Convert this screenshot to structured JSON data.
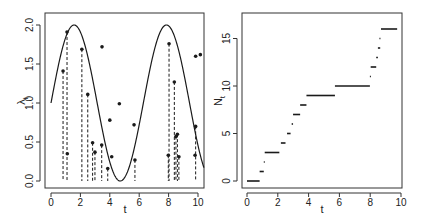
{
  "chart_data": [
    {
      "type": "scatter",
      "title": "",
      "xlabel": "t",
      "ylabel": "λ_t",
      "ylabel_main": "λ",
      "ylabel_sub": "t",
      "xlim": [
        0,
        10.4
      ],
      "ylim": [
        -0.05,
        2.1
      ],
      "xticks": [
        0,
        2,
        4,
        6,
        8,
        10
      ],
      "yticks": [
        0.0,
        0.5,
        1.0,
        1.5,
        2.0
      ],
      "ytick_labels": [
        "0.0",
        "0.5",
        "1.0",
        "1.5",
        "2.0"
      ],
      "grid": false,
      "legend": null,
      "curve": {
        "name": "intensity",
        "formula": "1 + sin(t)",
        "t_range": [
          0,
          10.4
        ],
        "style": "solid"
      },
      "points": [
        {
          "t": 0.82,
          "y": 1.41
        },
        {
          "t": 1.09,
          "y": 1.91
        },
        {
          "t": 1.11,
          "y": 0.35
        },
        {
          "t": 2.1,
          "y": 1.69
        },
        {
          "t": 2.5,
          "y": 1.11
        },
        {
          "t": 2.83,
          "y": 0.49
        },
        {
          "t": 2.99,
          "y": 0.37
        },
        {
          "t": 3.45,
          "y": 0.46
        },
        {
          "t": 3.47,
          "y": 1.72
        },
        {
          "t": 3.86,
          "y": 0.16
        },
        {
          "t": 4.0,
          "y": 0.78
        },
        {
          "t": 4.13,
          "y": 0.31
        },
        {
          "t": 4.65,
          "y": 0.99
        },
        {
          "t": 5.65,
          "y": 0.72
        },
        {
          "t": 5.71,
          "y": 0.27
        },
        {
          "t": 7.98,
          "y": 0.33
        },
        {
          "t": 8.03,
          "y": 1.76
        },
        {
          "t": 8.39,
          "y": 1.27
        },
        {
          "t": 8.5,
          "y": 0.57
        },
        {
          "t": 8.6,
          "y": 0.6
        },
        {
          "t": 8.7,
          "y": 0.31
        },
        {
          "t": 9.8,
          "y": 0.33
        },
        {
          "t": 9.84,
          "y": 0.7
        },
        {
          "t": 9.84,
          "y": 1.6
        },
        {
          "t": 10.16,
          "y": 1.62
        }
      ],
      "accepted_event_times": [
        0.82,
        1.09,
        2.1,
        2.5,
        2.83,
        2.99,
        3.45,
        3.86,
        5.71,
        7.98,
        8.03,
        8.39,
        8.5,
        8.6,
        8.7,
        9.8
      ],
      "dashed_lines": [
        {
          "t": 0.82,
          "y": 1.41
        },
        {
          "t": 1.09,
          "y": 1.91
        },
        {
          "t": 2.1,
          "y": 1.69
        },
        {
          "t": 2.5,
          "y": 1.11
        },
        {
          "t": 2.83,
          "y": 0.49
        },
        {
          "t": 2.99,
          "y": 0.37
        },
        {
          "t": 3.45,
          "y": 0.46
        },
        {
          "t": 3.86,
          "y": 0.16
        },
        {
          "t": 5.71,
          "y": 0.27
        },
        {
          "t": 7.98,
          "y": 0.33
        },
        {
          "t": 8.03,
          "y": 1.76
        },
        {
          "t": 8.39,
          "y": 1.27
        },
        {
          "t": 8.5,
          "y": 0.57
        },
        {
          "t": 8.6,
          "y": 0.6
        },
        {
          "t": 8.7,
          "y": 0.31
        },
        {
          "t": 9.84,
          "y": 0.7
        }
      ]
    },
    {
      "type": "step",
      "title": "",
      "xlabel": "t",
      "ylabel": "N_t",
      "ylabel_main": "N",
      "ylabel_sub": "t",
      "xlim": [
        -0.4,
        10.4
      ],
      "ylim": [
        -0.7,
        17.7
      ],
      "xticks": [
        0,
        2,
        4,
        6,
        8,
        10
      ],
      "yticks": [
        0,
        5,
        10,
        15
      ],
      "ytick_labels": [
        "0",
        "5",
        "10",
        "15"
      ],
      "grid": false,
      "legend": null,
      "steps": [
        {
          "n": 0,
          "t_start": 0.0,
          "t_end": 0.82
        },
        {
          "n": 1,
          "t_start": 0.82,
          "t_end": 1.09
        },
        {
          "n": 2,
          "t_start": 1.09,
          "t_end": 1.15
        },
        {
          "n": 3,
          "t_start": 1.15,
          "t_end": 2.1
        },
        {
          "n": 4,
          "t_start": 2.2,
          "t_end": 2.5
        },
        {
          "n": 5,
          "t_start": 2.6,
          "t_end": 2.83
        },
        {
          "n": 6,
          "t_start": 2.9,
          "t_end": 2.99
        },
        {
          "n": 7,
          "t_start": 2.99,
          "t_end": 3.45
        },
        {
          "n": 8,
          "t_start": 3.45,
          "t_end": 3.86
        },
        {
          "n": 9,
          "t_start": 3.86,
          "t_end": 5.71
        },
        {
          "n": 10,
          "t_start": 5.71,
          "t_end": 7.98
        },
        {
          "n": 11,
          "t_start": 7.98,
          "t_end": 8.03
        },
        {
          "n": 12,
          "t_start": 8.03,
          "t_end": 8.39
        },
        {
          "n": 13,
          "t_start": 8.39,
          "t_end": 8.5
        },
        {
          "n": 14,
          "t_start": 8.5,
          "t_end": 8.65
        },
        {
          "n": 15,
          "t_start": 8.6,
          "t_end": 8.66
        },
        {
          "n": 16,
          "t_start": 8.7,
          "t_end": 9.75
        }
      ]
    }
  ],
  "colors": {
    "ink": "#1a1a1a",
    "frame": "#333333",
    "background": "#ffffff"
  }
}
